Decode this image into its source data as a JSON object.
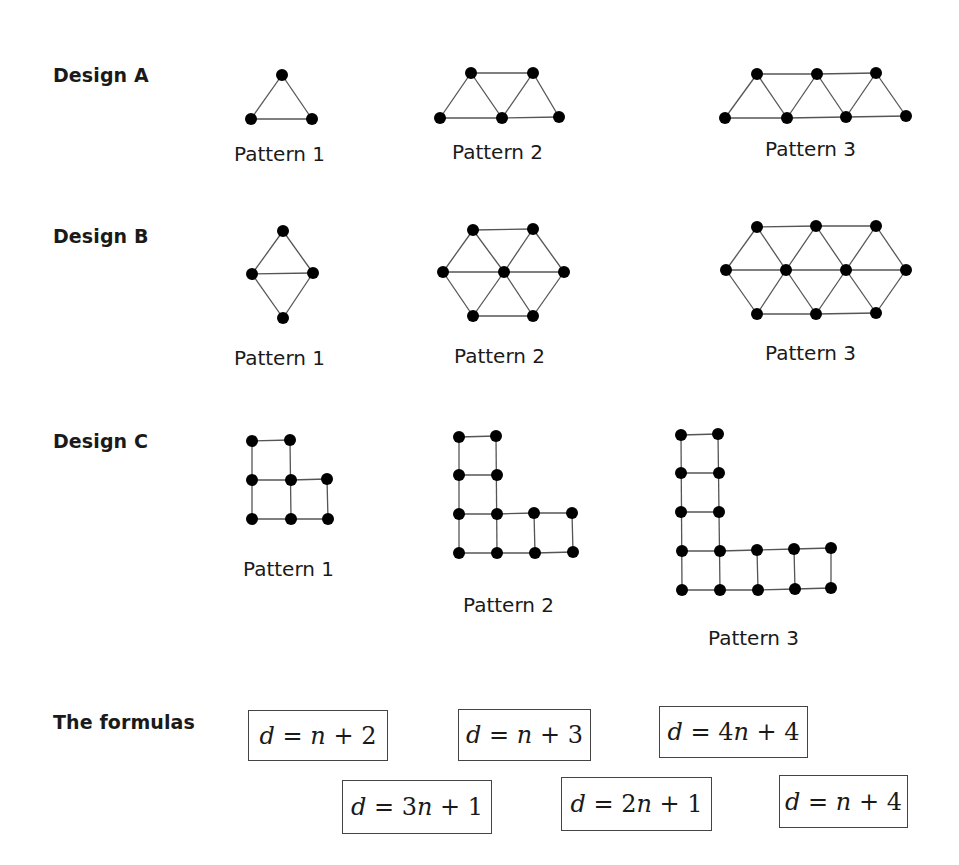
{
  "designs": [
    {
      "label": "Design A",
      "patterns": [
        "Pattern 1",
        "Pattern 2",
        "Pattern 3"
      ]
    },
    {
      "label": "Design B",
      "patterns": [
        "Pattern 1",
        "Pattern 2",
        "Pattern 3"
      ]
    },
    {
      "label": "Design C",
      "patterns": [
        "Pattern 1",
        "Pattern 2",
        "Pattern 3"
      ]
    }
  ],
  "formulas": {
    "label": "The formulas",
    "items": [
      "d = n + 2",
      "d = n + 3",
      "d = 4n + 4",
      "d = 3n + 1",
      "d = 2n + 1",
      "d = n + 4"
    ]
  },
  "colors": {
    "dot": "#000000",
    "line": "#555555",
    "box_border": "#444444"
  }
}
